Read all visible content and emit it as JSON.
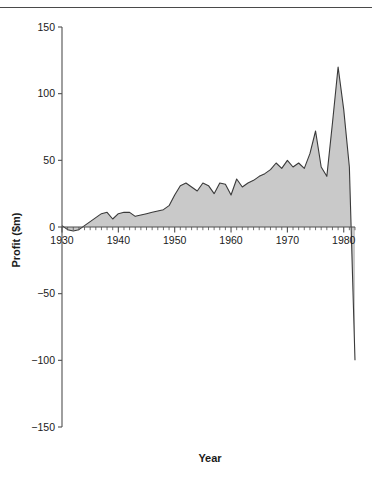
{
  "figure": {
    "caption_fragment": "",
    "top_rule": true
  },
  "chart_data": {
    "type": "area",
    "title": "",
    "subtitle": "",
    "xlabel": "Year",
    "ylabel": "Profit ($m)",
    "xlim": [
      1930,
      1982
    ],
    "ylim": [
      -150,
      150
    ],
    "grid": false,
    "legend": null,
    "fill_color": "#c9c9c9",
    "line_color": "#3a3a3a",
    "axis_color": "#4f4f4f",
    "y_ticks": [
      150,
      100,
      50,
      0,
      -50,
      -100,
      -150
    ],
    "y_tick_labels": [
      "150",
      "100",
      "50",
      "0",
      "−50",
      "−100",
      "−150"
    ],
    "x_ticks": [
      1930,
      1940,
      1950,
      1960,
      1970,
      1980
    ],
    "x_tick_labels": [
      "1930",
      "1940",
      "1950",
      "1960",
      "1970",
      "1980"
    ],
    "x_minor_tick_step": 1,
    "baseline": 0,
    "x": [
      1930,
      1931,
      1932,
      1933,
      1934,
      1935,
      1936,
      1937,
      1938,
      1939,
      1940,
      1941,
      1942,
      1943,
      1944,
      1945,
      1946,
      1947,
      1948,
      1949,
      1950,
      1951,
      1952,
      1953,
      1954,
      1955,
      1956,
      1957,
      1958,
      1959,
      1960,
      1961,
      1962,
      1963,
      1964,
      1965,
      1966,
      1967,
      1968,
      1969,
      1970,
      1971,
      1972,
      1973,
      1974,
      1975,
      1976,
      1977,
      1978,
      1979,
      1980,
      1981,
      1982
    ],
    "values": [
      1,
      -2,
      -3,
      -2,
      1,
      4,
      7,
      10,
      11,
      6,
      10,
      11,
      11,
      8,
      9,
      10,
      11,
      12,
      13,
      16,
      24,
      31,
      33,
      30,
      27,
      33,
      31,
      25,
      33,
      32,
      24,
      36,
      30,
      33,
      35,
      38,
      40,
      43,
      48,
      44,
      50,
      45,
      48,
      44,
      55,
      72,
      45,
      38,
      78,
      120,
      88,
      45,
      -100
    ],
    "annotations": [
      {
        "label": "peak",
        "x": 1979,
        "y": 120
      },
      {
        "label": "secondary peak",
        "x": 1975,
        "y": 72
      },
      {
        "label": "final collapse",
        "x": 1982,
        "y": -100
      }
    ]
  }
}
